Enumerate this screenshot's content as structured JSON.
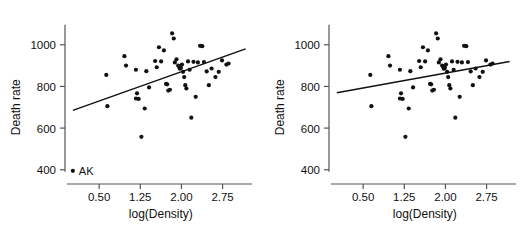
{
  "figure": {
    "width": 528,
    "height": 230,
    "background": "#ffffff",
    "point_color": "#111111",
    "line_color": "#111111",
    "axis_color": "#555555"
  },
  "chart_data": [
    {
      "type": "scatter",
      "title": "",
      "panel": "left",
      "xlabel": "log(Density)",
      "ylabel": "Death rate",
      "xlim": [
        -0.05,
        3.25
      ],
      "ylim": [
        370,
        1090
      ],
      "xticks": [
        0.5,
        1.25,
        2.0,
        2.75
      ],
      "xticklabels": [
        "0.50",
        "1.25",
        "2.00",
        "2.75"
      ],
      "yticks": [
        400,
        600,
        800,
        1000
      ],
      "yticklabels": [
        "400",
        "600",
        "800",
        "1000"
      ],
      "grid": false,
      "legend": "none",
      "annotations": [
        {
          "text": "AK",
          "x": 0.02,
          "y": 395
        }
      ],
      "series": [
        {
          "name": "states",
          "marker": "filled-circle",
          "points": [
            [
              0.02,
              395
            ],
            [
              0.63,
              855
            ],
            [
              0.65,
              705
            ],
            [
              0.96,
              945
            ],
            [
              0.99,
              900
            ],
            [
              1.17,
              880
            ],
            [
              1.19,
              767
            ],
            [
              1.17,
              742
            ],
            [
              1.22,
              740
            ],
            [
              1.27,
              558
            ],
            [
              1.33,
              694
            ],
            [
              1.36,
              873
            ],
            [
              1.41,
              795
            ],
            [
              1.52,
              922
            ],
            [
              1.55,
              892
            ],
            [
              1.59,
              988
            ],
            [
              1.63,
              920
            ],
            [
              1.68,
              973
            ],
            [
              1.72,
              812
            ],
            [
              1.74,
              810
            ],
            [
              1.76,
              780
            ],
            [
              1.79,
              784
            ],
            [
              1.83,
              1055
            ],
            [
              1.86,
              1030
            ],
            [
              1.88,
              915
            ],
            [
              1.91,
              930
            ],
            [
              1.94,
              900
            ],
            [
              1.96,
              893
            ],
            [
              1.97,
              885
            ],
            [
              1.99,
              889
            ],
            [
              2.01,
              905
            ],
            [
              2.03,
              870
            ],
            [
              2.05,
              845
            ],
            [
              2.07,
              806
            ],
            [
              2.09,
              790
            ],
            [
              2.12,
              920
            ],
            [
              2.15,
              880
            ],
            [
              2.18,
              650
            ],
            [
              2.22,
              918
            ],
            [
              2.26,
              750
            ],
            [
              2.3,
              915
            ],
            [
              2.34,
              995
            ],
            [
              2.38,
              993
            ],
            [
              2.41,
              917
            ],
            [
              2.46,
              872
            ],
            [
              2.5,
              806
            ],
            [
              2.55,
              886
            ],
            [
              2.62,
              845
            ],
            [
              2.68,
              870
            ],
            [
              2.74,
              925
            ],
            [
              2.82,
              905
            ],
            [
              2.86,
              910
            ]
          ]
        }
      ],
      "fit_line": {
        "name": "least-squares fit (with AK)",
        "x_start": 0.02,
        "y_start": 685,
        "x_end": 3.17,
        "y_end": 980
      }
    },
    {
      "type": "scatter",
      "title": "",
      "panel": "right",
      "xlabel": "log(Density)",
      "ylabel": "Death rate",
      "xlim": [
        -0.05,
        3.25
      ],
      "ylim": [
        370,
        1090
      ],
      "xticks": [
        0.5,
        1.25,
        2.0,
        2.75
      ],
      "xticklabels": [
        "0.50",
        "1.25",
        "2.00",
        "2.75"
      ],
      "yticks": [
        400,
        600,
        800,
        1000
      ],
      "yticklabels": [
        "400",
        "600",
        "800",
        "1000"
      ],
      "grid": false,
      "legend": "none",
      "annotations": [],
      "series": [
        {
          "name": "states",
          "marker": "filled-circle",
          "points": [
            [
              0.63,
              855
            ],
            [
              0.65,
              705
            ],
            [
              0.96,
              945
            ],
            [
              0.99,
              900
            ],
            [
              1.17,
              880
            ],
            [
              1.19,
              767
            ],
            [
              1.17,
              742
            ],
            [
              1.22,
              740
            ],
            [
              1.27,
              558
            ],
            [
              1.33,
              694
            ],
            [
              1.36,
              873
            ],
            [
              1.41,
              795
            ],
            [
              1.52,
              922
            ],
            [
              1.55,
              892
            ],
            [
              1.59,
              988
            ],
            [
              1.63,
              920
            ],
            [
              1.68,
              973
            ],
            [
              1.72,
              812
            ],
            [
              1.74,
              810
            ],
            [
              1.76,
              780
            ],
            [
              1.79,
              784
            ],
            [
              1.83,
              1055
            ],
            [
              1.86,
              1030
            ],
            [
              1.88,
              915
            ],
            [
              1.91,
              930
            ],
            [
              1.94,
              900
            ],
            [
              1.96,
              893
            ],
            [
              1.97,
              885
            ],
            [
              1.99,
              889
            ],
            [
              2.01,
              905
            ],
            [
              2.03,
              870
            ],
            [
              2.05,
              845
            ],
            [
              2.07,
              806
            ],
            [
              2.09,
              790
            ],
            [
              2.12,
              920
            ],
            [
              2.15,
              880
            ],
            [
              2.18,
              650
            ],
            [
              2.22,
              918
            ],
            [
              2.26,
              750
            ],
            [
              2.3,
              915
            ],
            [
              2.34,
              995
            ],
            [
              2.38,
              993
            ],
            [
              2.41,
              917
            ],
            [
              2.46,
              872
            ],
            [
              2.5,
              806
            ],
            [
              2.55,
              886
            ],
            [
              2.62,
              845
            ],
            [
              2.68,
              870
            ],
            [
              2.74,
              925
            ],
            [
              2.82,
              905
            ],
            [
              2.86,
              910
            ]
          ]
        }
      ],
      "fit_line": {
        "name": "least-squares fit (without AK)",
        "x_start": 0.02,
        "y_start": 770,
        "x_end": 3.17,
        "y_end": 920
      }
    }
  ]
}
